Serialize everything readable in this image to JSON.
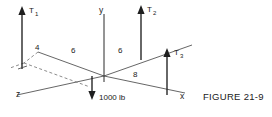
{
  "figure": {
    "caption": "FIGURE 21-9",
    "axes": {
      "y": "y",
      "x": "x",
      "z": "z"
    },
    "forces": [
      {
        "id": "T1",
        "base": "T",
        "sub": "1"
      },
      {
        "id": "T2",
        "base": "T",
        "sub": "2"
      },
      {
        "id": "T3",
        "base": "T",
        "sub": "3"
      }
    ],
    "load": {
      "label": "1000 lb"
    },
    "dimensions": [
      {
        "id": "dim-4",
        "value": "4"
      },
      {
        "id": "dim-6-left",
        "value": "6"
      },
      {
        "id": "dim-6-right",
        "value": "6"
      },
      {
        "id": "dim-8",
        "value": "8"
      }
    ],
    "colors": {
      "ink": "#1a1a1a",
      "line": "#2b2b2b",
      "thin_line": "#4a4a4a",
      "dashed_line": "#6e6e6e",
      "background": "#ffffff"
    }
  }
}
